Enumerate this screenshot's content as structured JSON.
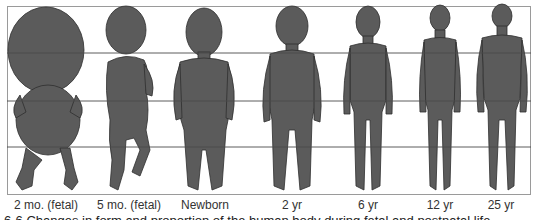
{
  "figure": {
    "stages": [
      {
        "label": "2 mo. (fetal)",
        "center_x": 46
      },
      {
        "label": "5 mo. (fetal)",
        "center_x": 129
      },
      {
        "label": "Newborn",
        "center_x": 205
      },
      {
        "label": "2 yr",
        "center_x": 292
      },
      {
        "label": "6 yr",
        "center_x": 368
      },
      {
        "label": "12 yr",
        "center_x": 440
      },
      {
        "label": "25 yr",
        "center_x": 501
      }
    ],
    "gridlines_y": [
      53,
      101,
      147
    ],
    "colors": {
      "body_fill": "#5b5b5b",
      "outline": "#2e2e2e",
      "gridline": "#4a4a4a",
      "frame": "#9a9a9a"
    }
  },
  "caption": "6-6  Changes in form and proportion of the human body during fetal and postnatal life."
}
